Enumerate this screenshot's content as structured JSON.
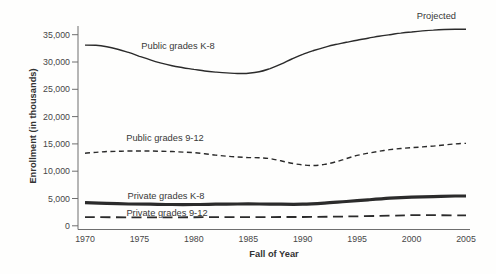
{
  "chart_data": {
    "type": "line",
    "title": "",
    "xlabel": "Fall of Year",
    "ylabel": "Enrollment (in thousands)",
    "xlim": [
      1970,
      2005
    ],
    "ylim": [
      0,
      36500
    ],
    "grid": false,
    "legend": "inline-labels",
    "x_ticks": [
      1970,
      1975,
      1980,
      1985,
      1990,
      1995,
      2000,
      2005
    ],
    "x_tick_labels": [
      "1970",
      "1975",
      "1980",
      "1985",
      "1990",
      "1995",
      "2000",
      "2005"
    ],
    "y_ticks": [
      0,
      5000,
      10000,
      15000,
      20000,
      25000,
      30000,
      35000
    ],
    "y_tick_labels": [
      "0",
      "5,000",
      "10,000",
      "15,000",
      "20,000",
      "25,000",
      "30,000",
      "35,000"
    ],
    "line_color": "#2b2b2b",
    "axis_color": "#6e6e6e",
    "annotations": [
      {
        "text": "Projected"
      }
    ],
    "series": [
      {
        "name": "Public grades K-8",
        "line_style": "solid",
        "line_width": 1.4,
        "points": [
          [
            1970,
            33100
          ],
          [
            1971,
            33050
          ],
          [
            1972,
            32800
          ],
          [
            1973,
            32350
          ],
          [
            1974,
            31750
          ],
          [
            1975,
            31050
          ],
          [
            1976,
            30400
          ],
          [
            1977,
            29800
          ],
          [
            1978,
            29300
          ],
          [
            1979,
            28950
          ],
          [
            1980,
            28650
          ],
          [
            1981,
            28350
          ],
          [
            1982,
            28150
          ],
          [
            1983,
            28000
          ],
          [
            1984,
            27900
          ],
          [
            1985,
            27950
          ],
          [
            1986,
            28200
          ],
          [
            1987,
            28800
          ],
          [
            1988,
            29600
          ],
          [
            1989,
            30550
          ],
          [
            1990,
            31400
          ],
          [
            1991,
            32100
          ],
          [
            1992,
            32700
          ],
          [
            1993,
            33200
          ],
          [
            1994,
            33600
          ],
          [
            1995,
            34000
          ],
          [
            1996,
            34350
          ],
          [
            1997,
            34700
          ],
          [
            1998,
            35000
          ],
          [
            1999,
            35300
          ],
          [
            2000,
            35500
          ],
          [
            2001,
            35700
          ],
          [
            2002,
            35850
          ],
          [
            2003,
            35950
          ],
          [
            2004,
            36000
          ],
          [
            2005,
            36000
          ]
        ]
      },
      {
        "name": "Public grades 9-12",
        "line_style": "short-dash",
        "line_width": 1.4,
        "points": [
          [
            1970,
            13300
          ],
          [
            1971,
            13450
          ],
          [
            1972,
            13600
          ],
          [
            1973,
            13650
          ],
          [
            1974,
            13700
          ],
          [
            1975,
            13700
          ],
          [
            1976,
            13700
          ],
          [
            1977,
            13650
          ],
          [
            1978,
            13600
          ],
          [
            1979,
            13500
          ],
          [
            1980,
            13400
          ],
          [
            1981,
            13200
          ],
          [
            1982,
            12950
          ],
          [
            1983,
            12750
          ],
          [
            1984,
            12600
          ],
          [
            1985,
            12500
          ],
          [
            1986,
            12450
          ],
          [
            1987,
            12300
          ],
          [
            1988,
            11900
          ],
          [
            1989,
            11450
          ],
          [
            1990,
            11150
          ],
          [
            1991,
            11050
          ],
          [
            1992,
            11250
          ],
          [
            1993,
            11700
          ],
          [
            1994,
            12300
          ],
          [
            1995,
            12900
          ],
          [
            1996,
            13300
          ],
          [
            1997,
            13650
          ],
          [
            1998,
            13950
          ],
          [
            1999,
            14150
          ],
          [
            2000,
            14300
          ],
          [
            2001,
            14450
          ],
          [
            2002,
            14600
          ],
          [
            2003,
            14800
          ],
          [
            2004,
            15000
          ],
          [
            2005,
            15100
          ]
        ]
      },
      {
        "name": "Private grades K-8",
        "line_style": "solid",
        "line_width": 3.2,
        "points": [
          [
            1970,
            4250
          ],
          [
            1972,
            4100
          ],
          [
            1974,
            4000
          ],
          [
            1976,
            3950
          ],
          [
            1978,
            3900
          ],
          [
            1980,
            3900
          ],
          [
            1982,
            3950
          ],
          [
            1984,
            4000
          ],
          [
            1986,
            4000
          ],
          [
            1988,
            3950
          ],
          [
            1990,
            3950
          ],
          [
            1992,
            4150
          ],
          [
            1994,
            4450
          ],
          [
            1996,
            4750
          ],
          [
            1998,
            5050
          ],
          [
            2000,
            5250
          ],
          [
            2002,
            5350
          ],
          [
            2004,
            5450
          ],
          [
            2005,
            5450
          ]
        ]
      },
      {
        "name": "Private grades 9-12",
        "line_style": "long-dash",
        "line_width": 1.8,
        "points": [
          [
            1970,
            1600
          ],
          [
            1974,
            1550
          ],
          [
            1978,
            1550
          ],
          [
            1982,
            1580
          ],
          [
            1986,
            1600
          ],
          [
            1990,
            1620
          ],
          [
            1994,
            1700
          ],
          [
            1998,
            1850
          ],
          [
            2000,
            1950
          ],
          [
            2002,
            1950
          ],
          [
            2004,
            1900
          ],
          [
            2005,
            1900
          ]
        ]
      }
    ]
  }
}
